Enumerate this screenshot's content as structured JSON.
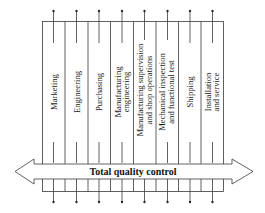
{
  "diagram": {
    "band_label": "Total quality control",
    "columns": [
      {
        "lines": [
          "Marketing"
        ]
      },
      {
        "lines": [
          "Engineering"
        ]
      },
      {
        "lines": [
          "Purchasing"
        ]
      },
      {
        "lines": [
          "Manufacturing",
          "engineering"
        ]
      },
      {
        "lines": [
          "Manufacturing supervision",
          "and shop operations"
        ]
      },
      {
        "lines": [
          "Mechanical inspection",
          "and functional test"
        ]
      },
      {
        "lines": [
          "Shipping"
        ]
      },
      {
        "lines": [
          "Installation",
          "and service"
        ]
      }
    ],
    "colors": {
      "line": "#3a3a3a",
      "text": "#1a1a1a",
      "background": "#ffffff"
    }
  }
}
